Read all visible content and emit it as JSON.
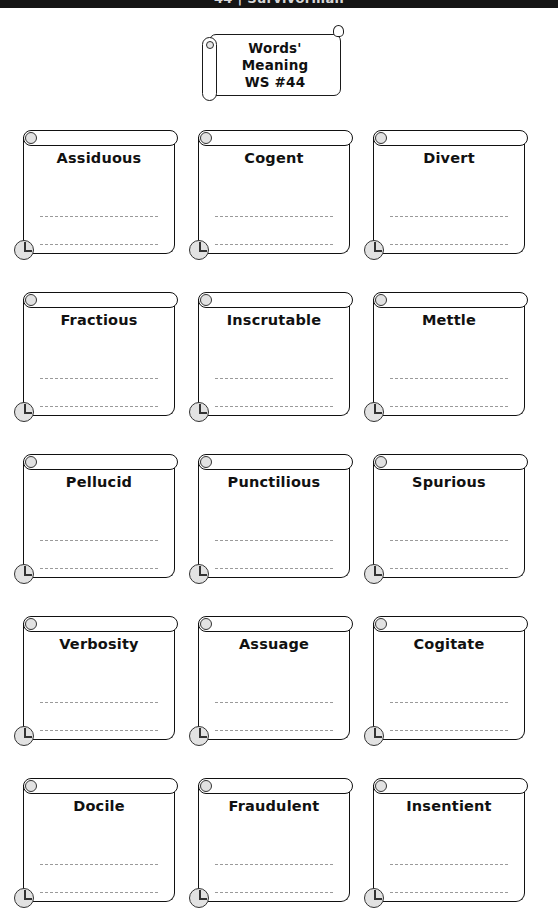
{
  "top_bar": {
    "text": "44  |  Survivorman"
  },
  "title_card": {
    "name": "title-scroll",
    "lines": [
      "Words'",
      "Meaning",
      "WS #44"
    ]
  },
  "worksheet": {
    "columns": 3,
    "rows": 5,
    "lines_per_card": 2,
    "cards": [
      {
        "word": "Assiduous"
      },
      {
        "word": "Cogent"
      },
      {
        "word": "Divert"
      },
      {
        "word": "Fractious"
      },
      {
        "word": "Inscrutable"
      },
      {
        "word": "Mettle"
      },
      {
        "word": "Pellucid"
      },
      {
        "word": "Punctilious"
      },
      {
        "word": "Spurious"
      },
      {
        "word": "Verbosity"
      },
      {
        "word": "Assuage"
      },
      {
        "word": "Cogitate"
      },
      {
        "word": "Docile"
      },
      {
        "word": "Fraudulent"
      },
      {
        "word": "Insentient"
      }
    ]
  },
  "colors": {
    "ink": "#111111",
    "rule": "#9a9a9a",
    "curl_fill": "#e2e2e2",
    "bar_background": "#151515",
    "page_background": "#ffffff"
  }
}
